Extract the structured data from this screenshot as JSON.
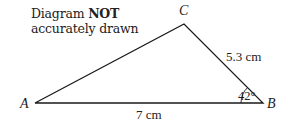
{
  "note": {
    "prefix": "Diagram ",
    "emphasis": "NOT",
    "line2": "accurately drawn"
  },
  "vertices": {
    "A": "A",
    "B": "B",
    "C": "C"
  },
  "measurements": {
    "AB": "7 cm",
    "BC": "5.3 cm",
    "angle_B": "42°"
  },
  "colors": {
    "line": "#1a1a1a",
    "text": "#222222"
  }
}
